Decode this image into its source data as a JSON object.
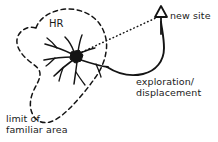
{
  "figure": {
    "type": "ecology-home-range-diagram",
    "background_color": "#ffffff",
    "ink_color": "#141414",
    "labels": {
      "home_range": "HR",
      "new_site": "new site",
      "exploration_line1": "exploration/",
      "exploration_line2": "displacement",
      "limit_line1": "limit of",
      "limit_line2": "familiar area"
    },
    "elements": {
      "home_range_boundary": "dashed irregular closed curve",
      "movement_network": "branching solid path network radiating from a filled central node",
      "exploration_path": "solid curved arc from network to new site marker",
      "sight_line": "dotted straight line from network to new site marker",
      "new_site_marker": "outlined triangle atop a vertical post"
    }
  }
}
